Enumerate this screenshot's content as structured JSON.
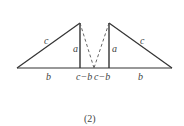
{
  "figure": {
    "caption": "(2)",
    "line_color": "#333333",
    "labels": {
      "left_hyp": "c",
      "left_height": "a",
      "left_base": "b",
      "left_gap": "c−b",
      "right_gap": "c−b",
      "right_height": "a",
      "right_hyp": "c",
      "right_base": "b"
    }
  }
}
